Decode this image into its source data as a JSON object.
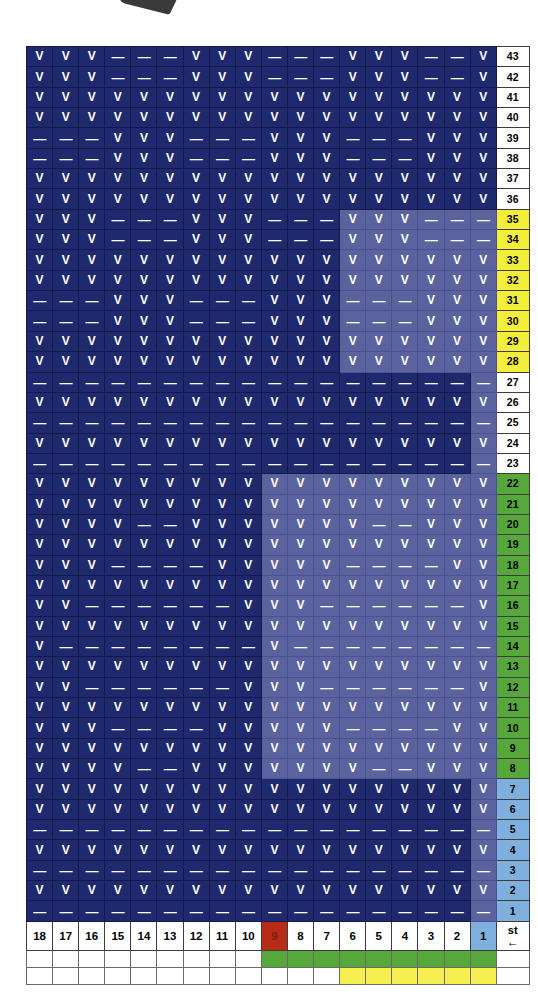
{
  "legend": {
    "present_symbol": "V",
    "absent_symbol": "—",
    "start_label": "st",
    "start_arrow": "←"
  },
  "colors": {
    "cell_base": "#1f2a6e",
    "cell_highlight": "#5a639e",
    "label_yellow": "#f2ee3a",
    "label_green": "#56a83a",
    "label_blue": "#7fb0dd",
    "col_red": "#b82b16",
    "bar_green": "#56a83a",
    "bar_yellow": "#f4ef4f",
    "text_on_cell": "#ffffff"
  },
  "columns": {
    "headers": [
      "18",
      "17",
      "16",
      "15",
      "14",
      "13",
      "12",
      "11",
      "10",
      "9",
      "8",
      "7",
      "6",
      "5",
      "4",
      "3",
      "2",
      "1"
    ],
    "highlight_header_index": 9,
    "highlight_header_value": "9",
    "blue_header_index": 17,
    "blue_header_value": "1"
  },
  "bars": {
    "green_row": {
      "start_index": 9,
      "end_index": 17
    },
    "yellow_row": {
      "start_index": 12,
      "end_index": 17
    }
  },
  "chart_data": {
    "type": "heatmap",
    "title": "",
    "xlabel": "",
    "ylabel": "",
    "x_tick_labels": [
      "18",
      "17",
      "16",
      "15",
      "14",
      "13",
      "12",
      "11",
      "10",
      "9",
      "8",
      "7",
      "6",
      "5",
      "4",
      "3",
      "2",
      "1"
    ],
    "y_tick_labels": [
      "43",
      "42",
      "41",
      "40",
      "39",
      "38",
      "37",
      "36",
      "35",
      "34",
      "33",
      "32",
      "31",
      "30",
      "29",
      "28",
      "27",
      "26",
      "25",
      "24",
      "23",
      "22",
      "21",
      "20",
      "19",
      "18",
      "17",
      "16",
      "15",
      "14",
      "13",
      "12",
      "11",
      "10",
      "9",
      "8",
      "7",
      "6",
      "5",
      "4",
      "3",
      "2",
      "1"
    ],
    "legend": [
      "V = present",
      "— = absent"
    ],
    "grid": true,
    "rows": [
      {
        "label": "43",
        "labelColor": "white",
        "hiStart": null,
        "cells": [
          "V",
          "V",
          "V",
          "-",
          "-",
          "-",
          "V",
          "V",
          "V",
          "-",
          "-",
          "-",
          "V",
          "V",
          "V",
          "-",
          "-",
          "V"
        ]
      },
      {
        "label": "42",
        "labelColor": "white",
        "hiStart": null,
        "cells": [
          "V",
          "V",
          "V",
          "-",
          "-",
          "-",
          "V",
          "V",
          "V",
          "-",
          "-",
          "-",
          "V",
          "V",
          "V",
          "-",
          "-",
          "V"
        ]
      },
      {
        "label": "41",
        "labelColor": "white",
        "hiStart": null,
        "cells": [
          "V",
          "V",
          "V",
          "V",
          "V",
          "V",
          "V",
          "V",
          "V",
          "V",
          "V",
          "V",
          "V",
          "V",
          "V",
          "V",
          "V",
          "V"
        ]
      },
      {
        "label": "40",
        "labelColor": "white",
        "hiStart": null,
        "cells": [
          "V",
          "V",
          "V",
          "V",
          "V",
          "V",
          "V",
          "V",
          "V",
          "V",
          "V",
          "V",
          "V",
          "V",
          "V",
          "V",
          "V",
          "V"
        ]
      },
      {
        "label": "39",
        "labelColor": "white",
        "hiStart": null,
        "cells": [
          "-",
          "-",
          "-",
          "V",
          "V",
          "V",
          "-",
          "-",
          "-",
          "V",
          "V",
          "V",
          "-",
          "-",
          "-",
          "V",
          "V",
          "V"
        ]
      },
      {
        "label": "38",
        "labelColor": "white",
        "hiStart": null,
        "cells": [
          "-",
          "-",
          "-",
          "V",
          "V",
          "V",
          "-",
          "-",
          "-",
          "V",
          "V",
          "V",
          "-",
          "-",
          "-",
          "V",
          "V",
          "V"
        ]
      },
      {
        "label": "37",
        "labelColor": "white",
        "hiStart": null,
        "cells": [
          "V",
          "V",
          "V",
          "V",
          "V",
          "V",
          "V",
          "V",
          "V",
          "V",
          "V",
          "V",
          "V",
          "V",
          "V",
          "V",
          "V",
          "V"
        ]
      },
      {
        "label": "36",
        "labelColor": "white",
        "hiStart": null,
        "cells": [
          "V",
          "V",
          "V",
          "V",
          "V",
          "V",
          "V",
          "V",
          "V",
          "V",
          "V",
          "V",
          "V",
          "V",
          "V",
          "V",
          "V",
          "V"
        ]
      },
      {
        "label": "35",
        "labelColor": "yellow",
        "hiStart": 12,
        "cells": [
          "V",
          "V",
          "V",
          "-",
          "-",
          "-",
          "V",
          "V",
          "V",
          "-",
          "-",
          "-",
          "V",
          "V",
          "V",
          "-",
          "-",
          "-"
        ]
      },
      {
        "label": "34",
        "labelColor": "yellow",
        "hiStart": 12,
        "cells": [
          "V",
          "V",
          "V",
          "-",
          "-",
          "-",
          "V",
          "V",
          "V",
          "-",
          "-",
          "-",
          "V",
          "V",
          "V",
          "-",
          "-",
          "-"
        ]
      },
      {
        "label": "33",
        "labelColor": "yellow",
        "hiStart": 12,
        "cells": [
          "V",
          "V",
          "V",
          "V",
          "V",
          "V",
          "V",
          "V",
          "V",
          "V",
          "V",
          "V",
          "V",
          "V",
          "V",
          "V",
          "V",
          "V"
        ]
      },
      {
        "label": "32",
        "labelColor": "yellow",
        "hiStart": 12,
        "cells": [
          "V",
          "V",
          "V",
          "V",
          "V",
          "V",
          "V",
          "V",
          "V",
          "V",
          "V",
          "V",
          "V",
          "V",
          "V",
          "V",
          "V",
          "V"
        ]
      },
      {
        "label": "31",
        "labelColor": "yellow",
        "hiStart": 12,
        "cells": [
          "-",
          "-",
          "-",
          "V",
          "V",
          "V",
          "-",
          "-",
          "-",
          "V",
          "V",
          "V",
          "-",
          "-",
          "-",
          "V",
          "V",
          "V"
        ]
      },
      {
        "label": "30",
        "labelColor": "yellow",
        "hiStart": 12,
        "cells": [
          "-",
          "-",
          "-",
          "V",
          "V",
          "V",
          "-",
          "-",
          "-",
          "V",
          "V",
          "V",
          "-",
          "-",
          "-",
          "V",
          "V",
          "V"
        ]
      },
      {
        "label": "29",
        "labelColor": "yellow",
        "hiStart": 12,
        "cells": [
          "V",
          "V",
          "V",
          "V",
          "V",
          "V",
          "V",
          "V",
          "V",
          "V",
          "V",
          "V",
          "V",
          "V",
          "V",
          "V",
          "V",
          "V"
        ]
      },
      {
        "label": "28",
        "labelColor": "yellow",
        "hiStart": 12,
        "cells": [
          "V",
          "V",
          "V",
          "V",
          "V",
          "V",
          "V",
          "V",
          "V",
          "V",
          "V",
          "V",
          "V",
          "V",
          "V",
          "V",
          "V",
          "V"
        ]
      },
      {
        "label": "27",
        "labelColor": "white",
        "hiStart": 17,
        "cells": [
          "-",
          "-",
          "-",
          "-",
          "-",
          "-",
          "-",
          "-",
          "-",
          "-",
          "-",
          "-",
          "-",
          "-",
          "-",
          "-",
          "-",
          "-"
        ]
      },
      {
        "label": "26",
        "labelColor": "white",
        "hiStart": 17,
        "cells": [
          "V",
          "V",
          "V",
          "V",
          "V",
          "V",
          "V",
          "V",
          "V",
          "V",
          "V",
          "V",
          "V",
          "V",
          "V",
          "V",
          "V",
          "V"
        ]
      },
      {
        "label": "25",
        "labelColor": "white",
        "hiStart": 17,
        "cells": [
          "-",
          "-",
          "-",
          "-",
          "-",
          "-",
          "-",
          "-",
          "-",
          "-",
          "-",
          "-",
          "-",
          "-",
          "-",
          "-",
          "-",
          "-"
        ]
      },
      {
        "label": "24",
        "labelColor": "white",
        "hiStart": 17,
        "cells": [
          "V",
          "V",
          "V",
          "V",
          "V",
          "V",
          "V",
          "V",
          "V",
          "V",
          "V",
          "V",
          "V",
          "V",
          "V",
          "V",
          "V",
          "V"
        ]
      },
      {
        "label": "23",
        "labelColor": "white",
        "hiStart": 17,
        "cells": [
          "-",
          "-",
          "-",
          "-",
          "-",
          "-",
          "-",
          "-",
          "-",
          "-",
          "-",
          "-",
          "-",
          "-",
          "-",
          "-",
          "-",
          "-"
        ]
      },
      {
        "label": "22",
        "labelColor": "green",
        "hiStart": 9,
        "cells": [
          "V",
          "V",
          "V",
          "V",
          "V",
          "V",
          "V",
          "V",
          "V",
          "V",
          "V",
          "V",
          "V",
          "V",
          "V",
          "V",
          "V",
          "V"
        ]
      },
      {
        "label": "21",
        "labelColor": "green",
        "hiStart": 9,
        "cells": [
          "V",
          "V",
          "V",
          "V",
          "V",
          "V",
          "V",
          "V",
          "V",
          "V",
          "V",
          "V",
          "V",
          "V",
          "V",
          "V",
          "V",
          "V"
        ]
      },
      {
        "label": "20",
        "labelColor": "green",
        "hiStart": 9,
        "cells": [
          "V",
          "V",
          "V",
          "V",
          "-",
          "-",
          "V",
          "V",
          "V",
          "V",
          "V",
          "V",
          "V",
          "-",
          "-",
          "V",
          "V",
          "V"
        ]
      },
      {
        "label": "19",
        "labelColor": "green",
        "hiStart": 9,
        "cells": [
          "V",
          "V",
          "V",
          "V",
          "V",
          "V",
          "V",
          "V",
          "V",
          "V",
          "V",
          "V",
          "V",
          "V",
          "V",
          "V",
          "V",
          "V"
        ]
      },
      {
        "label": "18",
        "labelColor": "green",
        "hiStart": 9,
        "cells": [
          "V",
          "V",
          "V",
          "-",
          "-",
          "-",
          "-",
          "V",
          "V",
          "V",
          "V",
          "V",
          "-",
          "-",
          "-",
          "-",
          "V",
          "V"
        ]
      },
      {
        "label": "17",
        "labelColor": "green",
        "hiStart": 9,
        "cells": [
          "V",
          "V",
          "V",
          "V",
          "V",
          "V",
          "V",
          "V",
          "V",
          "V",
          "V",
          "V",
          "V",
          "V",
          "V",
          "V",
          "V",
          "V"
        ]
      },
      {
        "label": "16",
        "labelColor": "green",
        "hiStart": 9,
        "cells": [
          "V",
          "V",
          "-",
          "-",
          "-",
          "-",
          "-",
          "-",
          "V",
          "V",
          "V",
          "-",
          "-",
          "-",
          "-",
          "-",
          "-",
          "V"
        ]
      },
      {
        "label": "15",
        "labelColor": "green",
        "hiStart": 9,
        "cells": [
          "V",
          "V",
          "V",
          "V",
          "V",
          "V",
          "V",
          "V",
          "V",
          "V",
          "V",
          "V",
          "V",
          "V",
          "V",
          "V",
          "V",
          "V"
        ]
      },
      {
        "label": "14",
        "labelColor": "green",
        "hiStart": 9,
        "cells": [
          "V",
          "-",
          "-",
          "-",
          "-",
          "-",
          "-",
          "-",
          "-",
          "V",
          "-",
          "-",
          "-",
          "-",
          "-",
          "-",
          "-",
          "-"
        ]
      },
      {
        "label": "13",
        "labelColor": "green",
        "hiStart": 9,
        "cells": [
          "V",
          "V",
          "V",
          "V",
          "V",
          "V",
          "V",
          "V",
          "V",
          "V",
          "V",
          "V",
          "V",
          "V",
          "V",
          "V",
          "V",
          "V"
        ]
      },
      {
        "label": "12",
        "labelColor": "green",
        "hiStart": 9,
        "cells": [
          "V",
          "V",
          "-",
          "-",
          "-",
          "-",
          "-",
          "-",
          "V",
          "V",
          "V",
          "-",
          "-",
          "-",
          "-",
          "-",
          "-",
          "V"
        ]
      },
      {
        "label": "11",
        "labelColor": "green",
        "hiStart": 9,
        "cells": [
          "V",
          "V",
          "V",
          "V",
          "V",
          "V",
          "V",
          "V",
          "V",
          "V",
          "V",
          "V",
          "V",
          "V",
          "V",
          "V",
          "V",
          "V"
        ]
      },
      {
        "label": "10",
        "labelColor": "green",
        "hiStart": 9,
        "cells": [
          "V",
          "V",
          "V",
          "-",
          "-",
          "-",
          "-",
          "V",
          "V",
          "V",
          "V",
          "V",
          "-",
          "-",
          "-",
          "-",
          "V",
          "V"
        ]
      },
      {
        "label": "9",
        "labelColor": "green",
        "hiStart": 9,
        "cells": [
          "V",
          "V",
          "V",
          "V",
          "V",
          "V",
          "V",
          "V",
          "V",
          "V",
          "V",
          "V",
          "V",
          "V",
          "V",
          "V",
          "V",
          "V"
        ]
      },
      {
        "label": "8",
        "labelColor": "green",
        "hiStart": 9,
        "cells": [
          "V",
          "V",
          "V",
          "V",
          "-",
          "-",
          "V",
          "V",
          "V",
          "V",
          "V",
          "V",
          "V",
          "-",
          "-",
          "V",
          "V",
          "V"
        ]
      },
      {
        "label": "7",
        "labelColor": "blue",
        "hiStart": 17,
        "cells": [
          "V",
          "V",
          "V",
          "V",
          "V",
          "V",
          "V",
          "V",
          "V",
          "V",
          "V",
          "V",
          "V",
          "V",
          "V",
          "V",
          "V",
          "V"
        ]
      },
      {
        "label": "6",
        "labelColor": "blue",
        "hiStart": 17,
        "cells": [
          "V",
          "V",
          "V",
          "V",
          "V",
          "V",
          "V",
          "V",
          "V",
          "V",
          "V",
          "V",
          "V",
          "V",
          "V",
          "V",
          "V",
          "V"
        ]
      },
      {
        "label": "5",
        "labelColor": "blue",
        "hiStart": 17,
        "cells": [
          "-",
          "-",
          "-",
          "-",
          "-",
          "-",
          "-",
          "-",
          "-",
          "-",
          "-",
          "-",
          "-",
          "-",
          "-",
          "-",
          "-",
          "-"
        ]
      },
      {
        "label": "4",
        "labelColor": "blue",
        "hiStart": 17,
        "cells": [
          "V",
          "V",
          "V",
          "V",
          "V",
          "V",
          "V",
          "V",
          "V",
          "V",
          "V",
          "V",
          "V",
          "V",
          "V",
          "V",
          "V",
          "V"
        ]
      },
      {
        "label": "3",
        "labelColor": "blue",
        "hiStart": 17,
        "cells": [
          "-",
          "-",
          "-",
          "-",
          "-",
          "-",
          "-",
          "-",
          "-",
          "-",
          "-",
          "-",
          "-",
          "-",
          "-",
          "-",
          "-",
          "-"
        ]
      },
      {
        "label": "2",
        "labelColor": "blue",
        "hiStart": 17,
        "cells": [
          "V",
          "V",
          "V",
          "V",
          "V",
          "V",
          "V",
          "V",
          "V",
          "V",
          "V",
          "V",
          "V",
          "V",
          "V",
          "V",
          "V",
          "V"
        ]
      },
      {
        "label": "1",
        "labelColor": "blue",
        "hiStart": 17,
        "cells": [
          "-",
          "-",
          "-",
          "-",
          "-",
          "-",
          "-",
          "-",
          "-",
          "-",
          "-",
          "-",
          "-",
          "-",
          "-",
          "-",
          "-",
          "-"
        ]
      }
    ]
  }
}
